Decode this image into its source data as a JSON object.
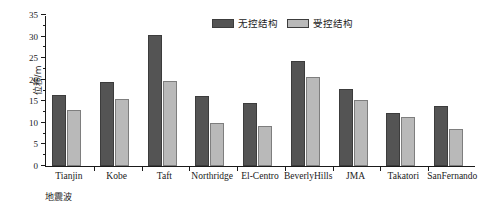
{
  "chart_data": {
    "type": "bar",
    "title": "",
    "xlabel": "地震波",
    "ylabel": "位移/m",
    "ylim": [
      0,
      35
    ],
    "ytick_values": [
      0,
      5,
      10,
      15,
      20,
      25,
      30,
      35
    ],
    "ytick_labels": [
      "0",
      "5",
      "10",
      "15",
      "20",
      "25",
      "30",
      "35"
    ],
    "minor_ytick_step": 2.5,
    "grid": false,
    "legend_position": "top-center",
    "categories": [
      "Tianjin",
      "Kobe",
      "Taft",
      "Northridge",
      "El-Centro",
      "BeverlyHills",
      "JMA",
      "Takatori",
      "SanFernando"
    ],
    "series": [
      {
        "name": "无控结构",
        "color": "#545454",
        "values": [
          16.5,
          19.5,
          30.3,
          16.3,
          14.6,
          24.4,
          17.9,
          12.3,
          13.9
        ]
      },
      {
        "name": "受控结构",
        "color": "#b9b9b9",
        "values": [
          13.0,
          15.5,
          19.6,
          10.0,
          9.3,
          20.7,
          15.3,
          11.3,
          8.6
        ]
      }
    ]
  }
}
